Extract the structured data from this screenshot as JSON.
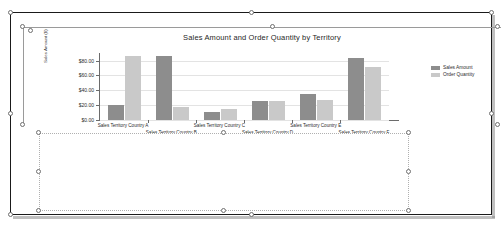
{
  "app": {
    "surface": "report-design-canvas",
    "selected_item": "chart"
  },
  "chart_data": {
    "type": "bar",
    "title": "Sales Amount and Order Quantity by Territory",
    "xlabel": "",
    "ylabel": "Sales Amount ($)",
    "ylim": [
      0,
      90
    ],
    "yticks": [
      "$0.00",
      "$20.00",
      "$40.00",
      "$60.00",
      "$80.00"
    ],
    "ytick_values": [
      0,
      20,
      40,
      60,
      80
    ],
    "grid": true,
    "legend_position": "right",
    "categories": [
      "Sales Territory Country A",
      "Sales Territory Country B",
      "Sales Territory Country C",
      "Sales Territory Country D",
      "Sales Territory Country E",
      "Sales Territory Country F"
    ],
    "series": [
      {
        "name": "Sales Amount",
        "color": "#8d8d8d",
        "values": [
          20,
          86,
          11,
          25,
          35,
          83
        ]
      },
      {
        "name": "Order Quantity",
        "color": "#c9c9c9",
        "values": [
          86,
          17,
          15,
          26,
          27,
          71
        ]
      }
    ]
  },
  "legend": {
    "items": [
      {
        "label": "Sales Amount"
      },
      {
        "label": "Order Quantity"
      }
    ]
  },
  "panel": {
    "label": ""
  },
  "colors": {
    "series_sales": "#8d8d8d",
    "series_orders": "#c9c9c9",
    "body_border": "#1a1a1a",
    "handle_border": "#6f6f6f",
    "panel_border": "#b0b0b0"
  }
}
